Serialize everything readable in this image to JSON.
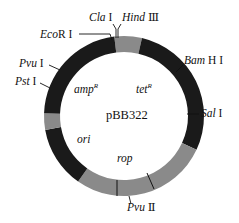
{
  "plasmid": {
    "name": "pBB322",
    "center_x": 124,
    "center_y": 116,
    "outer_radius": 80,
    "inner_radius": 64
  },
  "colors": {
    "dark_segment": "#1a1a1a",
    "gray_segment": "#8a8a8a",
    "text": "#111111",
    "background": "#ffffff"
  },
  "segments": [
    {
      "name": "top-gray",
      "start_deg": 77,
      "end_deg": 97,
      "shade": "gray"
    },
    {
      "name": "tet-region",
      "start_deg": -25,
      "end_deg": 77,
      "shade": "dark"
    },
    {
      "name": "rop-region",
      "start_deg": -125,
      "end_deg": -25,
      "shade": "gray"
    },
    {
      "name": "ori-region",
      "start_deg": -170,
      "end_deg": -125,
      "shade": "dark"
    },
    {
      "name": "left-gray",
      "start_deg": 178,
      "end_deg": 190,
      "shade": "gray"
    },
    {
      "name": "amp-region",
      "start_deg": 97,
      "end_deg": 178,
      "shade": "dark"
    }
  ],
  "genes": {
    "amp": {
      "base": "amp",
      "sup": "R"
    },
    "tet": {
      "base": "tet",
      "sup": "R"
    },
    "ori": "ori",
    "rop": "rop"
  },
  "sites": {
    "ecor1": {
      "italic": "Eco",
      "rest": "R I"
    },
    "cla1": {
      "italic": "Cla",
      "rest": " I"
    },
    "hind3": {
      "italic": "Hind",
      "rest": " Ⅲ"
    },
    "bamh1": {
      "italic": "Bam",
      "rest": " H I"
    },
    "sal1": {
      "italic": "Sal",
      "rest": " I"
    },
    "pvu2": {
      "italic": "Pvu",
      "rest": " Ⅱ"
    },
    "pvu1": {
      "italic": "Pvu",
      "rest": " I"
    },
    "pst1": {
      "italic": "Pst",
      "rest": " I"
    }
  }
}
